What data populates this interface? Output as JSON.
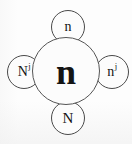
{
  "figure": {
    "type": "node-diagram",
    "background_color": "#fdfdfd",
    "stroke_color": "#4a4a4a",
    "text_color": "#141414"
  },
  "nodes": {
    "center": {
      "name": "center-node",
      "label_base": "n",
      "label_sup": ""
    },
    "top": {
      "name": "top-node",
      "label_base": "n",
      "label_sup": ""
    },
    "bottom": {
      "name": "bottom-node",
      "label_base": "N",
      "label_sup": ""
    },
    "left": {
      "name": "left-node",
      "label_base": "N",
      "label_sup": "j"
    },
    "right": {
      "name": "right-node",
      "label_base": "n",
      "label_sup": "j"
    }
  }
}
